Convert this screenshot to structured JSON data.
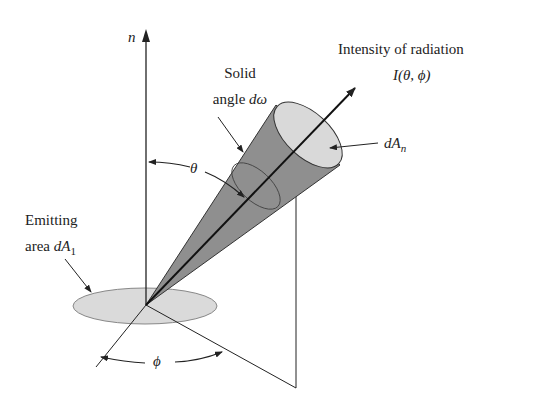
{
  "diagram": {
    "labels": {
      "normal_axis": "n",
      "solid_angle_line1": "Solid",
      "solid_angle_line2_text": "angle ",
      "solid_angle_symbol": "dω",
      "intensity_line1": "Intensity of radiation",
      "intensity_line2": "I(θ, ϕ)",
      "projected_area": "dA",
      "projected_area_sub": "n",
      "zenith_angle": "θ",
      "emitting_line1": "Emitting",
      "emitting_line2_text": "area ",
      "emitting_symbol": "dA",
      "emitting_sub": "1",
      "azimuth_angle": "ϕ"
    },
    "colors": {
      "line": "#222222",
      "cone_fill": "#8f8f8f",
      "ellipse_fill": "#d9d9d9"
    }
  }
}
